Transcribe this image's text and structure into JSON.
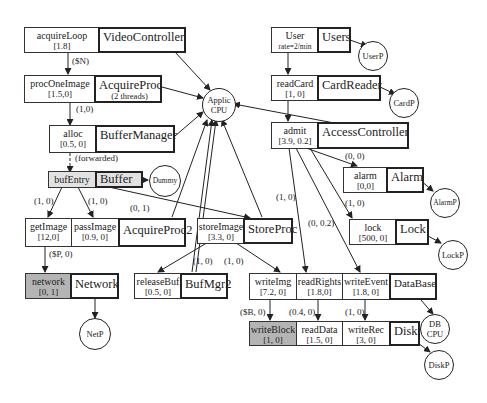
{
  "processors": {
    "applic_cpu": "Applic CPU",
    "userp": "UserP",
    "cardp": "CardP",
    "dummy": "Dummy",
    "alarmp": "AlarmP",
    "lockp": "LockP",
    "netp": "NetP",
    "db_cpu": "DB CPU",
    "diskp": "DiskP"
  },
  "tasks": {
    "video_controller": {
      "entry": "acquireLoop",
      "demand": "[1.8]",
      "task": "VideoController"
    },
    "acquire_proc": {
      "entry": "procOneImage",
      "demand": "[1.5,0]",
      "task": "AcquireProc",
      "note": "(2 threads)"
    },
    "buffer_manager": {
      "entry": "alloc",
      "demand": "[0.5, 0]",
      "task": "BufferManager"
    },
    "buffer": {
      "entry": "bufEntry",
      "task": "Buffer"
    },
    "acquire_proc2": {
      "entries": [
        {
          "entry": "getImage",
          "demand": "[12,0]"
        },
        {
          "entry": "passImage",
          "demand": "[0.9, 0]"
        }
      ],
      "task": "AcquireProc2"
    },
    "store_proc": {
      "entry": "storeImage",
      "demand": "[3.3, 0]",
      "task": "StoreProc"
    },
    "network": {
      "entry": "network",
      "demand": "[0, 1]",
      "task": "Network"
    },
    "buf_mgr2": {
      "entry": "releaseBuf",
      "demand": "[0.5, 0]",
      "task": "BufMgr2"
    },
    "users": {
      "entry": "User",
      "demand": "rate=2/min",
      "task": "Users"
    },
    "card_reader": {
      "entry": "readCard",
      "demand": "[1, 0]",
      "task": "CardReader"
    },
    "access_controller": {
      "entry": "admit",
      "demand": "[3.9, 0.2]",
      "task": "AccessController"
    },
    "alarm": {
      "entry": "alarm",
      "demand": "[0,0]",
      "task": "Alarm"
    },
    "lock": {
      "entry": "lock",
      "demand": "[500, 0]",
      "task": "Lock"
    },
    "database": {
      "entries": [
        {
          "entry": "writeImg",
          "demand": "[7.2, 0]"
        },
        {
          "entry": "readRights",
          "demand": "[1.8,0]"
        },
        {
          "entry": "writeEvent",
          "demand": "[1.8, 0]"
        }
      ],
      "task": "DataBase"
    },
    "disk": {
      "entries": [
        {
          "entry": "writeBlock",
          "demand": "[1, 0]"
        },
        {
          "entry": "readData",
          "demand": "[1.5, 0]"
        },
        {
          "entry": "writeRec",
          "demand": "[3, 0]"
        }
      ],
      "task": "Disk"
    }
  },
  "calls": {
    "acquire_to_proc": "($N)",
    "proc_to_alloc": "(1,0)",
    "alloc_to_buf": "(forwarded)",
    "buf_to_get": "(1, 0)",
    "buf_to_pass": "(1, 0)",
    "buf_to_store": "(0, 1)",
    "get_to_net": "($P, 0)",
    "store_to_release": "(1, 0)",
    "store_to_write": "(1, 0)",
    "admit_to_alarm": "(0, 0)",
    "admit_to_lock": "(1, 0)",
    "admit_to_rights": "(1, 0)",
    "admit_to_event": "(0, 0.2)",
    "write_to_block": "($B, 0)",
    "rights_to_data": "(0.4, 0)",
    "event_to_rec": "(1, 0)"
  }
}
